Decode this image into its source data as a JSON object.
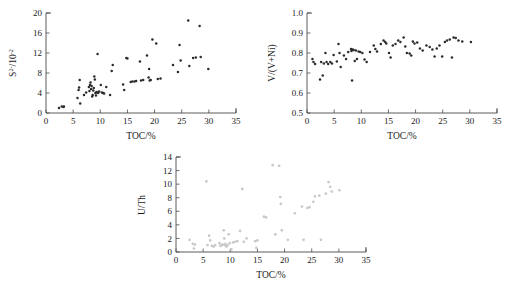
{
  "figure": {
    "caption": "",
    "panels": [
      "panel_a",
      "panel_b",
      "panel_c"
    ]
  },
  "chart_data": [
    {
      "id": "panel_a",
      "type": "scatter",
      "title": "",
      "xlabel": "TOC/%",
      "ylabel": "S2-/10-2",
      "ylabel_base": "S",
      "ylabel_sup1": "2-",
      "ylabel_mid": "/10",
      "ylabel_sup2": "-2",
      "xlim": [
        0,
        35
      ],
      "ylim": [
        0,
        20
      ],
      "xticks": [
        0,
        5,
        10,
        15,
        20,
        25,
        30,
        35
      ],
      "yticks": [
        0,
        4,
        8,
        12,
        16,
        20
      ],
      "grid": false,
      "legend": "none",
      "marker_color": "#2b2b2b",
      "points": [
        [
          2.4,
          1.0
        ],
        [
          2.9,
          1.3
        ],
        [
          3.2,
          1.2
        ],
        [
          3.3,
          1.3
        ],
        [
          5.8,
          3.0
        ],
        [
          6.0,
          4.6
        ],
        [
          6.1,
          5.1
        ],
        [
          6.2,
          6.6
        ],
        [
          6.3,
          1.9
        ],
        [
          7.0,
          3.6
        ],
        [
          7.4,
          4.1
        ],
        [
          7.9,
          5.2
        ],
        [
          8.0,
          4.4
        ],
        [
          8.1,
          5.6
        ],
        [
          8.2,
          6.1
        ],
        [
          8.3,
          4.8
        ],
        [
          8.4,
          5.4
        ],
        [
          8.5,
          3.3
        ],
        [
          8.6,
          3.6
        ],
        [
          8.7,
          4.5
        ],
        [
          8.8,
          5.0
        ],
        [
          8.9,
          7.3
        ],
        [
          9.0,
          6.7
        ],
        [
          9.1,
          4.0
        ],
        [
          9.2,
          3.5
        ],
        [
          9.3,
          4.2
        ],
        [
          9.4,
          4.1
        ],
        [
          9.5,
          11.8
        ],
        [
          9.6,
          4.0
        ],
        [
          9.8,
          4.3
        ],
        [
          10.1,
          5.6
        ],
        [
          10.3,
          4.1
        ],
        [
          10.5,
          4.0
        ],
        [
          10.7,
          3.9
        ],
        [
          11.1,
          5.2
        ],
        [
          11.8,
          3.6
        ],
        [
          12.1,
          8.4
        ],
        [
          12.3,
          9.6
        ],
        [
          14.2,
          5.7
        ],
        [
          14.4,
          4.6
        ],
        [
          14.8,
          11.0
        ],
        [
          15.0,
          10.9
        ],
        [
          15.6,
          6.2
        ],
        [
          15.9,
          6.3
        ],
        [
          16.3,
          6.3
        ],
        [
          16.6,
          6.4
        ],
        [
          17.3,
          10.3
        ],
        [
          17.5,
          6.5
        ],
        [
          17.9,
          6.6
        ],
        [
          18.6,
          11.5
        ],
        [
          18.9,
          7.1
        ],
        [
          19.0,
          8.8
        ],
        [
          19.1,
          6.5
        ],
        [
          19.3,
          6.6
        ],
        [
          19.6,
          14.7
        ],
        [
          20.3,
          13.9
        ],
        [
          20.6,
          6.8
        ],
        [
          21.1,
          6.9
        ],
        [
          23.4,
          9.6
        ],
        [
          24.3,
          8.2
        ],
        [
          24.6,
          13.6
        ],
        [
          24.8,
          10.5
        ],
        [
          26.2,
          18.5
        ],
        [
          26.4,
          9.4
        ],
        [
          27.1,
          11.0
        ],
        [
          27.6,
          11.1
        ],
        [
          28.3,
          17.4
        ],
        [
          28.5,
          11.2
        ],
        [
          29.9,
          8.8
        ]
      ]
    },
    {
      "id": "panel_b",
      "type": "scatter",
      "title": "",
      "xlabel": "TOC/%",
      "ylabel": "V/(V+Ni)",
      "xlim": [
        0,
        35
      ],
      "ylim": [
        0.5,
        1.0
      ],
      "xticks": [
        0,
        5,
        10,
        15,
        20,
        25,
        30,
        35
      ],
      "yticks": [
        0.5,
        0.6,
        0.7,
        0.8,
        0.9,
        1.0
      ],
      "ytick_labels": [
        "0.5",
        "0.6",
        "0.7",
        "0.8",
        "0.9",
        "1.0"
      ],
      "grid": false,
      "legend": "none",
      "marker_color": "#2b2b2b",
      "points": [
        [
          1.0,
          0.77
        ],
        [
          1.2,
          0.755
        ],
        [
          1.5,
          0.745
        ],
        [
          2.4,
          0.668
        ],
        [
          2.6,
          0.755
        ],
        [
          2.9,
          0.688
        ],
        [
          3.1,
          0.748
        ],
        [
          3.4,
          0.8
        ],
        [
          3.6,
          0.755
        ],
        [
          3.9,
          0.745
        ],
        [
          4.3,
          0.755
        ],
        [
          4.6,
          0.748
        ],
        [
          4.9,
          0.79
        ],
        [
          5.5,
          0.758
        ],
        [
          5.8,
          0.845
        ],
        [
          6.0,
          0.8
        ],
        [
          6.2,
          0.73
        ],
        [
          6.8,
          0.788
        ],
        [
          7.2,
          0.77
        ],
        [
          7.6,
          0.805
        ],
        [
          8.1,
          0.82
        ],
        [
          8.2,
          0.81
        ],
        [
          8.3,
          0.662
        ],
        [
          8.4,
          0.818
        ],
        [
          8.6,
          0.815
        ],
        [
          8.8,
          0.76
        ],
        [
          9.0,
          0.812
        ],
        [
          9.2,
          0.77
        ],
        [
          9.5,
          0.808
        ],
        [
          9.8,
          0.805
        ],
        [
          10.2,
          0.8
        ],
        [
          10.6,
          0.768
        ],
        [
          11.0,
          0.755
        ],
        [
          11.6,
          0.805
        ],
        [
          12.3,
          0.838
        ],
        [
          12.6,
          0.82
        ],
        [
          12.9,
          0.808
        ],
        [
          13.6,
          0.845
        ],
        [
          14.1,
          0.862
        ],
        [
          14.4,
          0.855
        ],
        [
          14.6,
          0.848
        ],
        [
          15.1,
          0.8
        ],
        [
          15.4,
          0.778
        ],
        [
          15.8,
          0.838
        ],
        [
          16.3,
          0.845
        ],
        [
          16.8,
          0.862
        ],
        [
          17.2,
          0.855
        ],
        [
          17.8,
          0.878
        ],
        [
          18.1,
          0.832
        ],
        [
          18.4,
          0.8
        ],
        [
          18.9,
          0.798
        ],
        [
          19.2,
          0.788
        ],
        [
          19.5,
          0.858
        ],
        [
          19.8,
          0.848
        ],
        [
          20.3,
          0.852
        ],
        [
          20.8,
          0.822
        ],
        [
          21.3,
          0.812
        ],
        [
          22.0,
          0.838
        ],
        [
          22.6,
          0.83
        ],
        [
          23.1,
          0.818
        ],
        [
          23.5,
          0.782
        ],
        [
          23.9,
          0.822
        ],
        [
          24.4,
          0.838
        ],
        [
          24.9,
          0.782
        ],
        [
          25.4,
          0.855
        ],
        [
          25.8,
          0.862
        ],
        [
          26.3,
          0.868
        ],
        [
          26.7,
          0.778
        ],
        [
          27.0,
          0.878
        ],
        [
          27.4,
          0.875
        ],
        [
          27.9,
          0.862
        ],
        [
          28.6,
          0.858
        ],
        [
          30.2,
          0.855
        ]
      ]
    },
    {
      "id": "panel_c",
      "type": "scatter",
      "title": "",
      "xlabel": "TOC/%",
      "ylabel": "U/Th",
      "xlim": [
        0,
        35
      ],
      "ylim": [
        0,
        14
      ],
      "xticks": [
        0,
        5,
        10,
        15,
        20,
        25,
        30,
        35
      ],
      "yticks": [
        0,
        2,
        4,
        6,
        8,
        10,
        12,
        14
      ],
      "grid": false,
      "legend": "none",
      "marker_color": "#c9c9c9",
      "points": [
        [
          2.5,
          1.8
        ],
        [
          3.1,
          1.2
        ],
        [
          3.3,
          0.5
        ],
        [
          3.5,
          1.1
        ],
        [
          5.6,
          10.4
        ],
        [
          5.8,
          1.0
        ],
        [
          6.1,
          2.4
        ],
        [
          6.3,
          1.7
        ],
        [
          6.6,
          0.9
        ],
        [
          6.9,
          0.8
        ],
        [
          7.2,
          1.0
        ],
        [
          8.0,
          1.3
        ],
        [
          8.2,
          0.9
        ],
        [
          8.4,
          1.0
        ],
        [
          8.6,
          1.1
        ],
        [
          8.8,
          3.2
        ],
        [
          8.9,
          2.0
        ],
        [
          9.0,
          1.0
        ],
        [
          9.1,
          1.2
        ],
        [
          9.3,
          0.8
        ],
        [
          9.5,
          1.0
        ],
        [
          9.7,
          2.6
        ],
        [
          9.9,
          1.3
        ],
        [
          10.2,
          0.4
        ],
        [
          10.5,
          1.4
        ],
        [
          10.8,
          1.5
        ],
        [
          11.3,
          1.6
        ],
        [
          11.8,
          3.1
        ],
        [
          12.2,
          9.3
        ],
        [
          12.5,
          1.5
        ],
        [
          13.0,
          2.0
        ],
        [
          14.6,
          1.6
        ],
        [
          14.8,
          0.6
        ],
        [
          15.0,
          1.7
        ],
        [
          16.2,
          5.2
        ],
        [
          16.6,
          5.1
        ],
        [
          17.8,
          12.8
        ],
        [
          18.3,
          2.6
        ],
        [
          19.0,
          12.7
        ],
        [
          19.2,
          8.1
        ],
        [
          19.3,
          7.1
        ],
        [
          19.5,
          3.2
        ],
        [
          20.6,
          1.8
        ],
        [
          21.9,
          5.7
        ],
        [
          23.2,
          6.7
        ],
        [
          23.5,
          1.8
        ],
        [
          24.2,
          6.5
        ],
        [
          24.6,
          6.6
        ],
        [
          25.3,
          7.4
        ],
        [
          25.6,
          8.2
        ],
        [
          26.4,
          8.3
        ],
        [
          26.7,
          1.8
        ],
        [
          27.6,
          8.6
        ],
        [
          28.1,
          10.3
        ],
        [
          28.4,
          9.6
        ],
        [
          28.7,
          8.9
        ],
        [
          30.1,
          9.1
        ]
      ]
    }
  ]
}
